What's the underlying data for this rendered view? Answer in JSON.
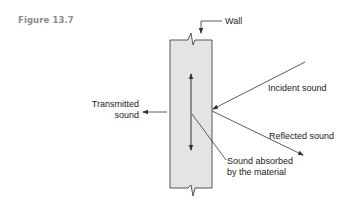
{
  "figure": {
    "label": "Figure 13.7"
  },
  "diagram": {
    "labels": {
      "wall": "Wall",
      "incident": "Incident sound",
      "reflected": "Reflected sound",
      "transmitted_line1": "Transmitted",
      "transmitted_line2": "sound",
      "absorbed_line1": "Sound absorbed",
      "absorbed_line2": "by the material"
    },
    "colors": {
      "wall_fill": "#e4e4e4",
      "stroke": "#333333",
      "figure_label": "#8a8a8a"
    }
  }
}
